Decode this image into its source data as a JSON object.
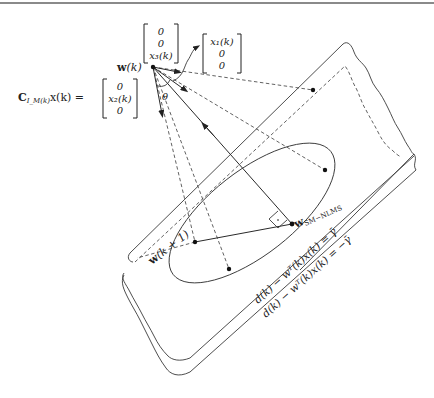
{
  "figure": {
    "labels": {
      "w_k": "w(k)",
      "w_k_bold": "w",
      "w_k_arg": "(k)",
      "w_k1": "w(k + 1)",
      "w_k1_bold": "w",
      "w_k1_arg": "(k + 1)",
      "w_sm": "w",
      "w_sm_sub": "SM−NLMS",
      "theta": "θ",
      "c_lhs_bold": "C",
      "c_lhs_sub": "I_M(k)",
      "c_lhs_rest": "x(k) =",
      "constraint_upper": "d(k) − wᵀ(k)x(k) = γ̄",
      "constraint_lower": "d(k) − wᵀ(k)x(k) = −γ̄"
    },
    "vectors": {
      "top": [
        "0",
        "0",
        "x₃(k)"
      ],
      "right": [
        "x₁(k)",
        "0",
        "0"
      ],
      "left": [
        "0",
        "x₂(k)",
        "0"
      ]
    },
    "points": {
      "w_k": [
        153,
        67
      ],
      "w_sm": [
        292,
        224
      ],
      "w_k1": [
        195,
        242
      ],
      "ellipse_low": [
        229,
        269
      ],
      "right_upper": [
        313,
        90
      ],
      "right_lower": [
        325,
        170
      ]
    },
    "colors": {
      "line": "#3a3a3a",
      "dot": "#111111",
      "background": "#ffffff"
    }
  }
}
